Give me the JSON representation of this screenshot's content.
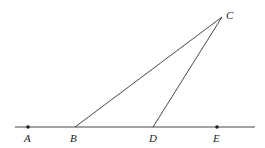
{
  "diagram": {
    "points": {
      "A": {
        "label": "A",
        "x": 28,
        "y": 127,
        "dot": true
      },
      "B": {
        "label": "B",
        "x": 75,
        "y": 127,
        "dot": false
      },
      "C": {
        "label": "C",
        "x": 222,
        "y": 17,
        "dot": false
      },
      "D": {
        "label": "D",
        "x": 153,
        "y": 127,
        "dot": false
      },
      "E": {
        "label": "E",
        "x": 217,
        "y": 127,
        "dot": true
      }
    },
    "line_color": "#333333"
  }
}
